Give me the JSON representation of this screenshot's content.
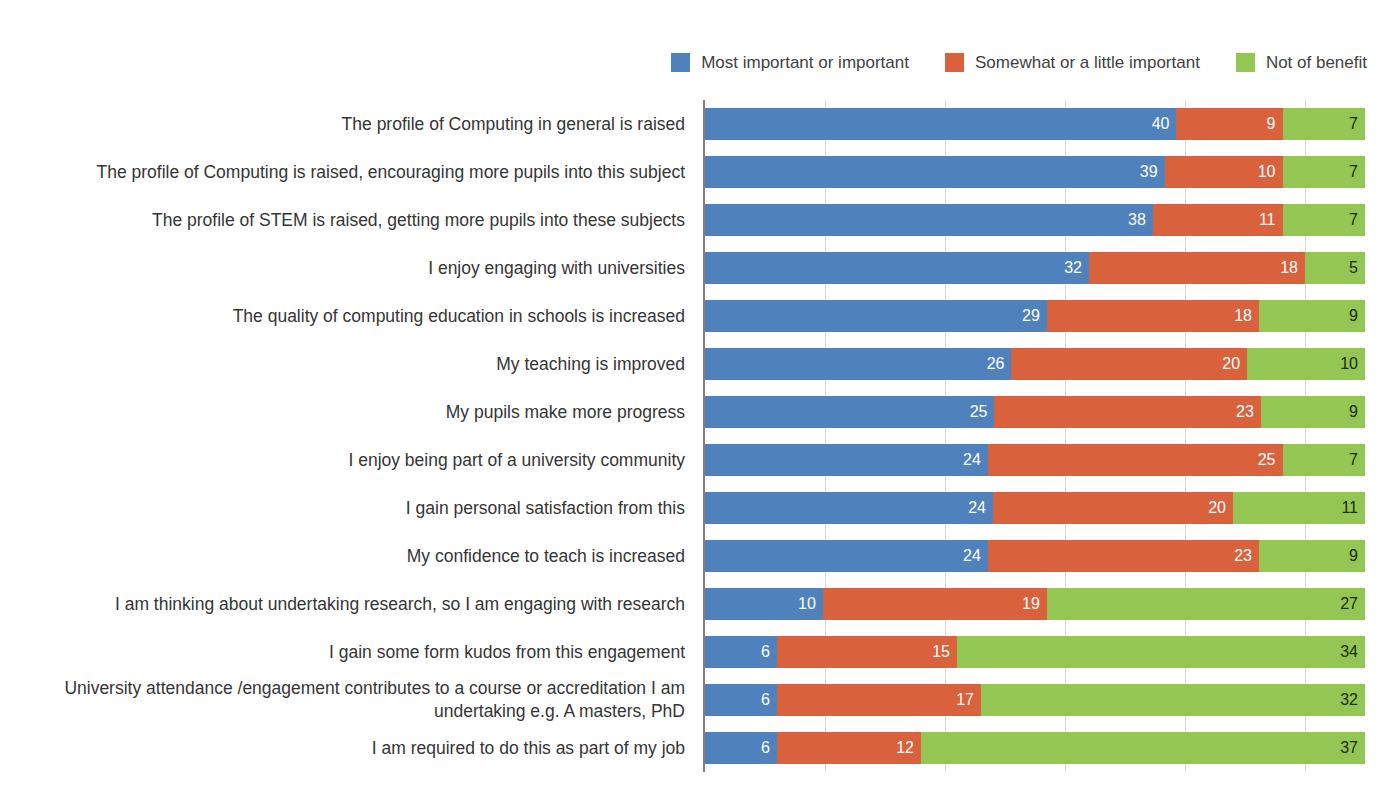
{
  "legend": {
    "position": "top-right",
    "items": [
      {
        "label": "Most important or important",
        "color": "#4f81bd",
        "icon": "legend-swatch-blue"
      },
      {
        "label": "Somewhat or a little important",
        "color": "#d9613c",
        "icon": "legend-swatch-orange"
      },
      {
        "label": "Not of benefit",
        "color": "#94c653",
        "icon": "legend-swatch-green"
      }
    ]
  },
  "axis": {
    "gridlines_at": [
      0,
      10,
      20,
      30,
      40,
      50
    ],
    "xmax": 55,
    "show_tick_labels": false
  },
  "chart_data": {
    "type": "bar",
    "title": "",
    "subtitle": "",
    "xlabel": "",
    "ylabel": "",
    "orientation": "horizontal",
    "stacked": true,
    "grid": true,
    "legend_position": "top-right",
    "xlim": [
      0,
      55
    ],
    "tick_labels": [],
    "categories": [
      "The profile of Computing in general is raised",
      "The profile of Computing is raised, encouraging more pupils into this subject",
      "The profile of STEM is raised, getting more pupils into these subjects",
      "I enjoy engaging with universities",
      "The quality of computing education in schools is increased",
      "My teaching is improved",
      "My pupils make more progress",
      "I enjoy being part of a university community",
      "I gain personal satisfaction from this",
      "My confidence to teach is increased",
      "I am thinking about undertaking research, so I am engaging with research",
      "I gain some form kudos from this engagement",
      "University attendance /engagement contributes to a course or accreditation I am undertaking e.g. A masters, PhD",
      "I am required to do this as part of my job"
    ],
    "series": [
      {
        "name": "Most important or important",
        "color": "#4f81bd",
        "values": [
          40,
          39,
          38,
          32,
          29,
          26,
          25,
          24,
          24,
          24,
          10,
          6,
          6,
          6
        ]
      },
      {
        "name": "Somewhat or a little important",
        "color": "#d9613c",
        "values": [
          9,
          10,
          11,
          18,
          18,
          20,
          23,
          25,
          20,
          23,
          19,
          15,
          17,
          12
        ]
      },
      {
        "name": "Not of benefit",
        "color": "#94c653",
        "values": [
          7,
          7,
          7,
          5,
          9,
          10,
          9,
          7,
          11,
          9,
          27,
          34,
          32,
          37
        ]
      }
    ]
  }
}
